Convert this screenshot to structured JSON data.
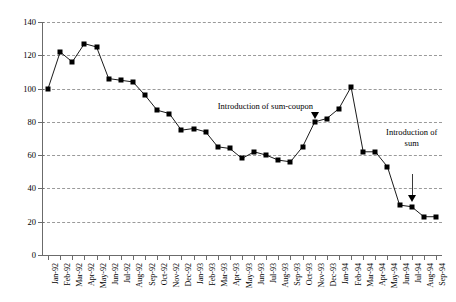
{
  "chart_data": {
    "type": "line",
    "title": "",
    "subtitle": "",
    "xlabel": "",
    "ylabel": "",
    "ylim": [
      0,
      140
    ],
    "ytick_step": 20,
    "yticks": [
      0,
      20,
      40,
      60,
      80,
      100,
      120,
      140
    ],
    "grid": true,
    "legend": "none",
    "marker": "filled-square",
    "categories": [
      "Jan-92",
      "Feb-92",
      "Mar-92",
      "Apr-92",
      "May-92",
      "Jun-92",
      "Jul-92",
      "Aug-92",
      "Sep-92",
      "Oct-92",
      "Nov-92",
      "Dec-92",
      "Jan-93",
      "Feb-93",
      "Mar-93",
      "Apr-93",
      "May-93",
      "Jun-93",
      "Jul-93",
      "Aug-93",
      "Sep-93",
      "Oct-93",
      "Nov-93",
      "Dec-93",
      "Jan-94",
      "Feb-94",
      "Mar-94",
      "Apr-94",
      "May-94",
      "Jun-94",
      "Jul-94",
      "Aug-94",
      "Sep-94"
    ],
    "series": [
      {
        "name": "index",
        "values": [
          100,
          122,
          116,
          127,
          125,
          106,
          105,
          104,
          96,
          87,
          85,
          75,
          76,
          74,
          65,
          64,
          58,
          62,
          60,
          57,
          56,
          65,
          80,
          82,
          88,
          101,
          62,
          62,
          53,
          30,
          29,
          23,
          23
        ]
      }
    ],
    "annotations": [
      {
        "id": "sum-coupon",
        "text": "Introduction of sum-coupon",
        "target_category": "Nov-93",
        "target_value": 80
      },
      {
        "id": "sum",
        "text_line1": "Introduction of",
        "text_line2": "sum",
        "target_category": "Jul-94",
        "target_value": 30
      }
    ]
  }
}
